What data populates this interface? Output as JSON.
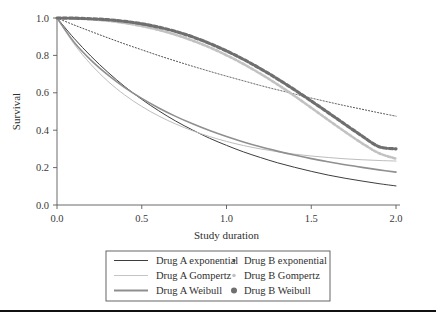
{
  "figure": {
    "background": "#ffffff",
    "has_bottom_rule": true
  },
  "chart_data": {
    "type": "line",
    "title": "",
    "xlabel": "Study duration",
    "ylabel": "Survival",
    "xlim": [
      0.0,
      2.0
    ],
    "ylim": [
      0.0,
      1.0
    ],
    "xticks": [
      "0.0",
      "0.5",
      "1.0",
      "1.5",
      "2.0"
    ],
    "xtick_values": [
      0.0,
      0.5,
      1.0,
      1.5,
      2.0
    ],
    "yticks": [
      "0.0",
      "0.2",
      "0.4",
      "0.6",
      "0.8",
      "1.0"
    ],
    "ytick_values": [
      0.0,
      0.2,
      0.4,
      0.6,
      0.8,
      1.0
    ],
    "grid": false,
    "legend_position": "below-axes",
    "x": [
      0.0,
      0.1,
      0.2,
      0.3,
      0.4,
      0.5,
      0.6,
      0.7,
      0.8,
      0.9,
      1.0,
      1.1,
      1.2,
      1.3,
      1.4,
      1.5,
      1.6,
      1.7,
      1.8,
      1.9,
      2.0
    ],
    "series": [
      {
        "name": "Drug A exponential",
        "style": "solid",
        "color": "#3d3d3d",
        "width": 1.0,
        "values": [
          1.0,
          0.892,
          0.796,
          0.71,
          0.633,
          0.565,
          0.504,
          0.449,
          0.401,
          0.357,
          0.319,
          0.284,
          0.254,
          0.226,
          0.202,
          0.18,
          0.16,
          0.143,
          0.128,
          0.114,
          0.102
        ]
      },
      {
        "name": "Drug A Gompertz",
        "style": "solid",
        "color": "#bdbdbd",
        "width": 1.0,
        "values": [
          1.0,
          0.862,
          0.752,
          0.662,
          0.588,
          0.527,
          0.476,
          0.433,
          0.397,
          0.366,
          0.34,
          0.318,
          0.3,
          0.285,
          0.272,
          0.262,
          0.254,
          0.247,
          0.242,
          0.238,
          0.235
        ]
      },
      {
        "name": "Drug A Weibull",
        "style": "solid",
        "color": "#8f8f8f",
        "width": 1.6,
        "values": [
          1.0,
          0.872,
          0.775,
          0.696,
          0.628,
          0.57,
          0.519,
          0.474,
          0.434,
          0.398,
          0.366,
          0.337,
          0.311,
          0.288,
          0.267,
          0.248,
          0.231,
          0.215,
          0.201,
          0.188,
          0.176
        ]
      },
      {
        "name": "Drug B exponential",
        "style": "dotted",
        "color": "#4a4a4a",
        "width": 1.0,
        "values": [
          1.0,
          0.963,
          0.928,
          0.894,
          0.861,
          0.83,
          0.799,
          0.77,
          0.742,
          0.715,
          0.689,
          0.664,
          0.639,
          0.616,
          0.594,
          0.572,
          0.551,
          0.531,
          0.512,
          0.493,
          0.475
        ]
      },
      {
        "name": "Drug B Gompertz",
        "style": "dotted",
        "color": "#c2c2c2",
        "width": 2.6,
        "values": [
          1.0,
          0.998,
          0.993,
          0.985,
          0.973,
          0.957,
          0.936,
          0.91,
          0.879,
          0.843,
          0.801,
          0.754,
          0.702,
          0.645,
          0.584,
          0.52,
          0.455,
          0.391,
          0.33,
          0.277,
          0.248
        ]
      },
      {
        "name": "Drug B Weibull",
        "style": "dotted",
        "color": "#6f6f6f",
        "width": 3.2,
        "values": [
          1.0,
          0.999,
          0.996,
          0.991,
          0.982,
          0.969,
          0.951,
          0.928,
          0.899,
          0.864,
          0.824,
          0.779,
          0.729,
          0.675,
          0.617,
          0.556,
          0.494,
          0.431,
          0.369,
          0.312,
          0.3
        ]
      }
    ]
  },
  "legend": {
    "entries": [
      {
        "label": "Drug A exponential",
        "kind": "line",
        "color": "#3d3d3d",
        "width": 1.0,
        "column": 0,
        "row": 0
      },
      {
        "label": "Drug A Gompertz",
        "kind": "line",
        "color": "#c4c4c4",
        "width": 1.0,
        "column": 0,
        "row": 1
      },
      {
        "label": "Drug A Weibull",
        "kind": "line",
        "color": "#8f8f8f",
        "width": 1.8,
        "column": 0,
        "row": 2
      },
      {
        "label": "Drug B exponential",
        "kind": "marker",
        "color": "#4a4a4a",
        "marker_size": 1.4,
        "column": 1,
        "row": 0
      },
      {
        "label": "Drug B Gompertz",
        "kind": "marker",
        "color": "#c2c2c2",
        "marker_size": 1.8,
        "column": 1,
        "row": 1
      },
      {
        "label": "Drug B Weibull",
        "kind": "marker",
        "color": "#6f6f6f",
        "marker_size": 3.0,
        "column": 1,
        "row": 2
      }
    ]
  }
}
